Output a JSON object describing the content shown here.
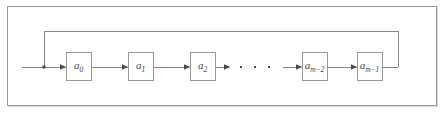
{
  "figure": {
    "type": "block-diagram",
    "frame": {
      "border_color": "#9a9a9a",
      "background": "#ffffff"
    },
    "line_color": "#7d7d7d",
    "box_border_color": "#8f8f8f",
    "label_color": "#4a4a4a",
    "cells": [
      {
        "id": "cell-0",
        "base": "a",
        "subscript": "0"
      },
      {
        "id": "cell-1",
        "base": "a",
        "subscript": "1"
      },
      {
        "id": "cell-2",
        "base": "a",
        "subscript": "2"
      },
      {
        "id": "cell-m-2",
        "base": "a",
        "subscript": "m−2"
      },
      {
        "id": "cell-m-1",
        "base": "a",
        "subscript": "m−1"
      }
    ],
    "ellipsis": "·  ·  ·",
    "junction": {
      "x": 44,
      "y": 67
    },
    "feedback_line_y": 31,
    "baseline_y": 67
  }
}
